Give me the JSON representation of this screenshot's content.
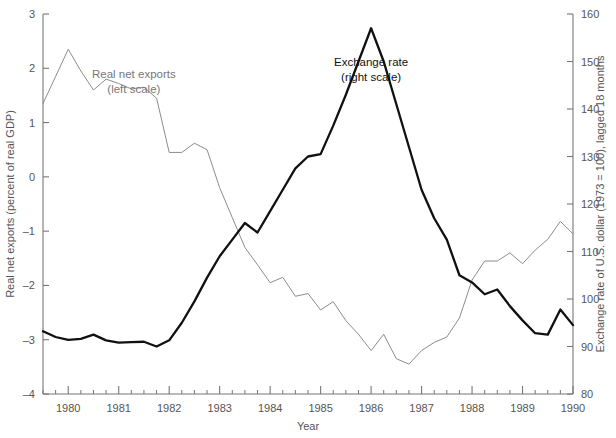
{
  "chart_data": {
    "type": "line",
    "title": "",
    "xlabel": "Year",
    "ylabel_left": "Real net exports (percent of real GDP)",
    "ylabel_right": "Exchange rate of U.S. dollar (1973 = 100), lagged 18 months",
    "xlim": [
      1979.5,
      1990.0
    ],
    "ylim_left": [
      -4,
      3
    ],
    "ylim_right": [
      80,
      160
    ],
    "grid": false,
    "legend_position": "inline-annotations",
    "xticks_major": [
      "1980",
      "1981",
      "1982",
      "1983",
      "1984",
      "1985",
      "1986",
      "1987",
      "1988",
      "1989",
      "1990"
    ],
    "xticks_major_values": [
      1980,
      1981,
      1982,
      1983,
      1984,
      1985,
      1986,
      1987,
      1988,
      1989,
      1990
    ],
    "xticks_minor_step": 0.25,
    "yticks_left": [
      "3",
      "2",
      "1",
      "0",
      "-1",
      "-2",
      "-3",
      "-4"
    ],
    "yticks_left_values": [
      3,
      2,
      1,
      0,
      -1,
      -2,
      -3,
      -4
    ],
    "yticks_right": [
      "160",
      "150",
      "140",
      "130",
      "120",
      "110",
      "100",
      "90",
      "80"
    ],
    "yticks_right_values": [
      160,
      150,
      140,
      130,
      120,
      110,
      100,
      90,
      80
    ],
    "annotations": [
      {
        "text": "Real net exports",
        "text2": "(left scale)",
        "x": 1981.3,
        "y_left": 1.82,
        "color": "#808080"
      },
      {
        "text": "Exchange rate",
        "text2": "(right scale)",
        "x": 1986.0,
        "y_right": 149.0,
        "color": "#111111"
      }
    ],
    "series": [
      {
        "name": "Real net exports",
        "axis": "left",
        "color": "#8c8c8c",
        "width": 1.0,
        "x": [
          1979.5,
          1979.75,
          1980.0,
          1980.25,
          1980.5,
          1980.75,
          1981.0,
          1981.25,
          1981.5,
          1981.75,
          1982.0,
          1982.25,
          1982.5,
          1982.75,
          1983.0,
          1983.25,
          1983.5,
          1983.75,
          1984.0,
          1984.25,
          1984.5,
          1984.75,
          1985.0,
          1985.25,
          1985.5,
          1985.75,
          1986.0,
          1986.25,
          1986.5,
          1986.75,
          1987.0,
          1987.25,
          1987.5,
          1987.75,
          1988.0,
          1988.25,
          1988.5,
          1988.75,
          1989.0,
          1989.25,
          1989.5,
          1989.75,
          1990.0
        ],
        "values": [
          1.35,
          1.85,
          2.35,
          1.95,
          1.6,
          1.8,
          1.72,
          1.62,
          1.65,
          1.45,
          0.45,
          0.45,
          0.62,
          0.5,
          -0.2,
          -0.75,
          -1.3,
          -1.62,
          -1.95,
          -1.85,
          -2.2,
          -2.15,
          -2.45,
          -2.3,
          -2.65,
          -2.9,
          -3.2,
          -2.9,
          -3.35,
          -3.45,
          -3.2,
          -3.05,
          -2.95,
          -2.6,
          -1.9,
          -1.55,
          -1.55,
          -1.4,
          -1.6,
          -1.35,
          -1.15,
          -0.82,
          -1.05
        ]
      },
      {
        "name": "Exchange rate",
        "axis": "right",
        "color": "#111111",
        "width": 2.3,
        "x": [
          1979.5,
          1979.75,
          1980.0,
          1980.25,
          1980.5,
          1980.75,
          1981.0,
          1981.25,
          1981.5,
          1981.75,
          1982.0,
          1982.25,
          1982.5,
          1982.75,
          1983.0,
          1983.25,
          1983.5,
          1983.75,
          1984.0,
          1984.25,
          1984.5,
          1984.75,
          1985.0,
          1985.25,
          1985.5,
          1985.75,
          1986.0,
          1986.25,
          1986.5,
          1986.75,
          1987.0,
          1987.25,
          1987.5,
          1987.75,
          1988.0,
          1988.25,
          1988.5,
          1988.75,
          1989.0,
          1989.25,
          1989.5,
          1989.75,
          1990.0
        ],
        "values": [
          93.2,
          92.0,
          91.4,
          91.6,
          92.5,
          91.3,
          90.8,
          90.9,
          91.0,
          90.0,
          91.3,
          95.0,
          99.5,
          104.5,
          109.0,
          112.5,
          116.0,
          114.0,
          118.5,
          123.0,
          127.5,
          130.0,
          130.5,
          136.5,
          143.0,
          150.0,
          157.0,
          150.0,
          141.0,
          132.0,
          123.0,
          117.0,
          112.5,
          105.0,
          103.5,
          101.0,
          102.0,
          98.5,
          95.5,
          92.8,
          92.5,
          97.8,
          94.5
        ]
      }
    ]
  }
}
